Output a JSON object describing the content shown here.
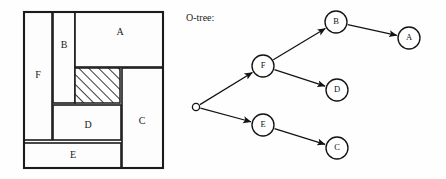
{
  "figure": {
    "width": 446,
    "height": 179,
    "background": "#fefefe",
    "ink_color": "#1b1b1b"
  },
  "floorplan": {
    "name": "floorplan-packing",
    "outline": {
      "x": 24,
      "y": 12,
      "width": 139,
      "height": 156
    },
    "blocks": [
      {
        "id": "F",
        "label": "F",
        "x": 24,
        "y": 12,
        "width": 28,
        "height": 128,
        "label_x": 38,
        "label_y": 76
      },
      {
        "id": "B",
        "label": "B",
        "x": 53,
        "y": 12,
        "width": 22,
        "height": 91,
        "label_x": 64,
        "label_y": 46
      },
      {
        "id": "A",
        "label": "A",
        "x": 75,
        "y": 12,
        "width": 88,
        "height": 55,
        "label_x": 120,
        "label_y": 33
      },
      {
        "id": "C",
        "label": "C",
        "x": 122,
        "y": 68,
        "width": 41,
        "height": 100,
        "label_x": 142,
        "label_y": 122
      },
      {
        "id": "D",
        "label": "D",
        "x": 53,
        "y": 105,
        "width": 68,
        "height": 35,
        "label_x": 88,
        "label_y": 126
      },
      {
        "id": "E",
        "label": "E",
        "x": 24,
        "y": 143,
        "width": 97,
        "height": 25,
        "label_x": 73,
        "label_y": 156
      }
    ],
    "dead_space": {
      "id": "hatched-dead-space",
      "x": 75,
      "y": 68,
      "width": 45,
      "height": 35,
      "fill_pattern": "diagonal-hatch"
    }
  },
  "tree": {
    "caption": "O-tree:",
    "caption_x": 186,
    "caption_y": 19,
    "node_radius": 11,
    "root": {
      "id": "root",
      "x": 196,
      "y": 107,
      "radius": 3.6
    },
    "nodes": [
      {
        "id": "F",
        "label": "F",
        "x": 263,
        "y": 66
      },
      {
        "id": "B",
        "label": "B",
        "x": 336,
        "y": 22
      },
      {
        "id": "A",
        "label": "A",
        "x": 409,
        "y": 38
      },
      {
        "id": "D",
        "label": "D",
        "x": 337,
        "y": 90
      },
      {
        "id": "E",
        "label": "E",
        "x": 263,
        "y": 125
      },
      {
        "id": "C",
        "label": "C",
        "x": 337,
        "y": 148
      }
    ],
    "edges": [
      {
        "from": "root",
        "to": "F"
      },
      {
        "from": "root",
        "to": "E"
      },
      {
        "from": "F",
        "to": "B"
      },
      {
        "from": "F",
        "to": "D"
      },
      {
        "from": "B",
        "to": "A"
      },
      {
        "from": "E",
        "to": "C"
      }
    ]
  }
}
